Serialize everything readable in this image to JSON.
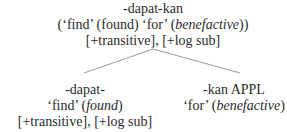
{
  "tree": {
    "root": {
      "form": "-dapat-kan",
      "gloss_open": "(‘find’ (found) ‘for’ (",
      "gloss_italic": "benefactive",
      "gloss_close": "))",
      "features": "[+transitive], [+log sub]"
    },
    "left": {
      "form": "-dapat-",
      "gloss_open": "‘find’ (",
      "gloss_italic": "found",
      "gloss_close": ")",
      "features": "[+transitive], [+log sub]"
    },
    "right": {
      "form": "-kan APPL",
      "gloss_open": "‘for’ (",
      "gloss_italic": "benefactive",
      "gloss_close": ")"
    },
    "edge_color": "#9a9a9a"
  }
}
